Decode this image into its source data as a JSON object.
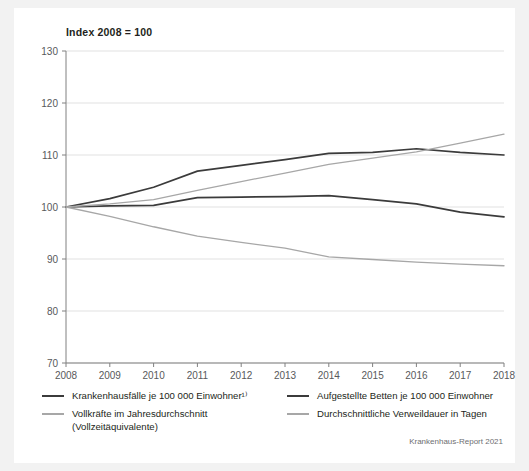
{
  "figure": {
    "title": "Index 2008  = 100",
    "source_credit": "Krankenhaus-Report 2021",
    "background_color": "#f2f2f2",
    "card_color": "#ffffff"
  },
  "chart_data": {
    "type": "line",
    "title": "Index 2008  = 100",
    "xlabel": "",
    "ylabel": "",
    "x": [
      2008,
      2009,
      2010,
      2011,
      2012,
      2013,
      2014,
      2015,
      2016,
      2017,
      2018
    ],
    "categories": [
      "2008",
      "2009",
      "2010",
      "2011",
      "2012",
      "2013",
      "2014",
      "2015",
      "2016",
      "2017",
      "2018"
    ],
    "xlim": [
      2008,
      2018
    ],
    "ylim": [
      70,
      130
    ],
    "yticks": [
      70,
      80,
      90,
      100,
      110,
      120,
      130
    ],
    "grid": "horizontal",
    "legend_position": "below",
    "series": [
      {
        "name": "Krankenhausfälle je 100 000 Einwohner¹⁾",
        "color": "#3b3b3b",
        "width": 1.7,
        "values": [
          100.0,
          101.6,
          103.8,
          106.9,
          108.0,
          109.1,
          110.3,
          110.5,
          111.2,
          110.5,
          110.0
        ]
      },
      {
        "name": "Aufgestellte Betten je 100 000 Einwohner",
        "color": "#3b3b3b",
        "width": 1.7,
        "values": [
          100.0,
          100.2,
          100.3,
          101.8,
          101.9,
          102.0,
          102.2,
          101.4,
          100.6,
          99.0,
          98.1
        ]
      },
      {
        "name": "Vollkräfte im Jahresdurchschnitt\n(Vollzeitäquivalente)",
        "color": "#a7a7a7",
        "width": 1.3,
        "values": [
          100.0,
          100.6,
          101.4,
          103.2,
          104.9,
          106.5,
          108.2,
          109.4,
          110.6,
          112.3,
          114.0
        ]
      },
      {
        "name": "Durchschnittliche Verweildauer in Tagen",
        "color": "#a7a7a7",
        "width": 1.3,
        "values": [
          100.0,
          98.2,
          96.2,
          94.4,
          93.2,
          92.1,
          90.4,
          89.9,
          89.4,
          89.0,
          88.7
        ]
      }
    ]
  },
  "legend": {
    "entries": [
      {
        "label": "Krankenhausfälle je 100 000 Einwohner¹⁾",
        "color": "#3b3b3b",
        "thickness": "2px"
      },
      {
        "label": "Aufgestellte Betten je 100 000 Einwohner",
        "color": "#3b3b3b",
        "thickness": "2px"
      },
      {
        "label": "Vollkräfte im Jahresdurchschnitt\n(Vollzeitäquivalente)",
        "color": "#a7a7a7",
        "thickness": "1.5px"
      },
      {
        "label": "Durchschnittliche Verweildauer in Tagen",
        "color": "#a7a7a7",
        "thickness": "1.5px"
      }
    ]
  }
}
